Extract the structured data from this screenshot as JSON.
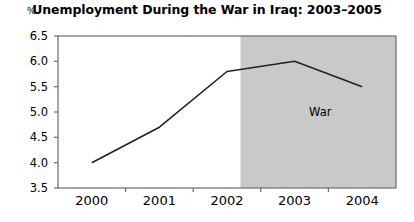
{
  "chart_data": {
    "type": "line",
    "title": "Unemployment During the War in Iraq: 2003–2005",
    "xlabel": "",
    "ylabel": "%",
    "categories": [
      "2000",
      "2001",
      "2002",
      "2003",
      "2004"
    ],
    "x": [
      2000,
      2001,
      2002,
      2003,
      2004
    ],
    "values": [
      4.0,
      4.7,
      5.8,
      6.0,
      5.5
    ],
    "series": [
      {
        "name": "Unemployment rate",
        "values": [
          4.0,
          4.7,
          5.8,
          6.0,
          5.5
        ]
      }
    ],
    "ylim": [
      3.5,
      6.5
    ],
    "yticks": [
      "3.5",
      "4.0",
      "4.5",
      "5.0",
      "5.5",
      "6.0",
      "6.5"
    ],
    "ytick_values": [
      3.5,
      4.0,
      4.5,
      5.0,
      5.5,
      6.0,
      6.5
    ],
    "xticks": [
      "2000",
      "2001",
      "2002",
      "2003",
      "2004"
    ],
    "grid": false,
    "legend": "none",
    "annotations": [
      {
        "text": "War",
        "region_start_x": 2002.6,
        "region_end_x": 2004.5,
        "shading": "#c9c9c9"
      }
    ],
    "colors": {
      "line": "#222222",
      "shaded_region": "#c9c9c9",
      "axis": "#6b6b6b",
      "background": "#ffffff"
    }
  },
  "labels": {
    "title": "Unemployment During the War in Iraq: 2003–2005",
    "y_unit": "%",
    "war": "War"
  }
}
